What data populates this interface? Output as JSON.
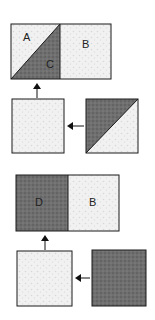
{
  "diagram": {
    "type": "quilt-block-assembly",
    "colors": {
      "light": "#efefef",
      "dark": "#6e6e6e",
      "outline": "#1a1a1a",
      "arrow": "#111111"
    },
    "step1": {
      "result": {
        "left_label_top": "A",
        "left_label_bottom": "C",
        "right_label": "B"
      },
      "inputs": [
        "plain-light-square",
        "half-square-triangle"
      ]
    },
    "step2": {
      "result": {
        "left_label": "D",
        "right_label": "B"
      },
      "inputs": [
        "plain-light-square",
        "plain-dark-square"
      ]
    }
  }
}
